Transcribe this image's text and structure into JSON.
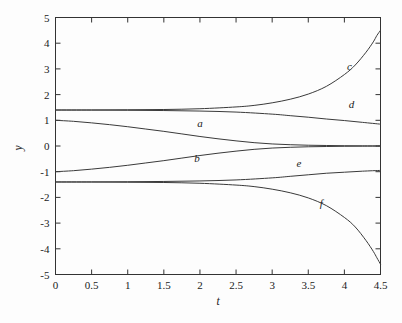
{
  "chart_data": {
    "type": "line",
    "title": "",
    "xlabel": "t",
    "ylabel": "y",
    "xlim": [
      0,
      4.5
    ],
    "ylim": [
      -5,
      5
    ],
    "grid": false,
    "legend": "inline-curve-labels",
    "xticks": [
      "0",
      "0.5",
      "1",
      "1.5",
      "2",
      "2.5",
      "3",
      "3.5",
      "4",
      "4.5"
    ],
    "xtick_values": [
      0,
      0.5,
      1,
      1.5,
      2,
      2.5,
      3,
      3.5,
      4,
      4.5
    ],
    "yticks": [
      "5",
      "4",
      "3",
      "2",
      "1",
      "0",
      "-1",
      "-2",
      "-3",
      "-4",
      "-5"
    ],
    "ytick_values": [
      5,
      4,
      3,
      2,
      1,
      0,
      -1,
      -2,
      -3,
      -4,
      -5
    ],
    "series": [
      {
        "name": "a",
        "label": "a",
        "label_at": [
          2.0,
          0.72
        ],
        "x": [
          0,
          0.25,
          0.5,
          0.75,
          1,
          1.25,
          1.5,
          1.75,
          2,
          2.25,
          2.5,
          2.75,
          3,
          3.25,
          3.5,
          3.75,
          4,
          4.25,
          4.5
        ],
        "y": [
          1.0,
          0.96,
          0.9,
          0.83,
          0.75,
          0.66,
          0.57,
          0.47,
          0.37,
          0.28,
          0.2,
          0.13,
          0.08,
          0.05,
          0.03,
          0.02,
          0.01,
          0.005,
          0.0
        ]
      },
      {
        "name": "b",
        "label": "b",
        "label_at": [
          1.96,
          -0.62
        ],
        "x": [
          0,
          0.25,
          0.5,
          0.75,
          1,
          1.25,
          1.5,
          1.75,
          2,
          2.25,
          2.5,
          2.75,
          3,
          3.25,
          3.5,
          3.75,
          4,
          4.25,
          4.5
        ],
        "y": [
          -1.0,
          -0.96,
          -0.9,
          -0.83,
          -0.75,
          -0.66,
          -0.57,
          -0.47,
          -0.37,
          -0.28,
          -0.2,
          -0.13,
          -0.08,
          -0.05,
          -0.03,
          -0.02,
          -0.01,
          -0.005,
          0.0
        ]
      },
      {
        "name": "c",
        "label": "c",
        "label_at": [
          4.07,
          2.95
        ],
        "x": [
          0,
          0.5,
          1,
          1.5,
          2,
          2.5,
          2.75,
          3,
          3.25,
          3.5,
          3.75,
          4,
          4.15,
          4.3,
          4.4,
          4.45,
          4.5
        ],
        "y": [
          1.4,
          1.4,
          1.41,
          1.42,
          1.45,
          1.52,
          1.58,
          1.68,
          1.82,
          2.02,
          2.32,
          2.78,
          3.15,
          3.65,
          4.05,
          4.3,
          4.5
        ]
      },
      {
        "name": "d",
        "label": "d",
        "label_at": [
          4.1,
          1.48
        ],
        "x": [
          0,
          0.5,
          1,
          1.5,
          2,
          2.5,
          3,
          3.25,
          3.5,
          3.75,
          4,
          4.25,
          4.5
        ],
        "y": [
          1.4,
          1.4,
          1.39,
          1.38,
          1.36,
          1.32,
          1.24,
          1.18,
          1.12,
          1.05,
          0.99,
          0.92,
          0.85
        ]
      },
      {
        "name": "e",
        "label": "e",
        "label_at": [
          3.37,
          -0.8
        ],
        "x": [
          0,
          0.5,
          1,
          1.5,
          2,
          2.5,
          3,
          3.25,
          3.5,
          3.75,
          4,
          4.25,
          4.5
        ],
        "y": [
          -1.4,
          -1.4,
          -1.39,
          -1.38,
          -1.36,
          -1.32,
          -1.24,
          -1.18,
          -1.12,
          -1.06,
          -1.02,
          -0.98,
          -0.95
        ]
      },
      {
        "name": "f",
        "label": "f",
        "label_at": [
          3.68,
          -2.38
        ],
        "x": [
          0,
          0.5,
          1,
          1.5,
          2,
          2.5,
          2.75,
          3,
          3.25,
          3.5,
          3.75,
          4,
          4.15,
          4.3,
          4.4,
          4.45,
          4.5
        ],
        "y": [
          -1.4,
          -1.4,
          -1.41,
          -1.42,
          -1.45,
          -1.52,
          -1.58,
          -1.68,
          -1.82,
          -2.02,
          -2.32,
          -2.78,
          -3.15,
          -3.68,
          -4.1,
          -4.35,
          -4.6
        ]
      }
    ]
  },
  "axes": {
    "x_title": "t",
    "y_title": "y"
  },
  "colors": {
    "curve": "#3a3a3a",
    "frame": "#333333",
    "background": "#fdfdfd",
    "text": "#1a1a1a"
  }
}
